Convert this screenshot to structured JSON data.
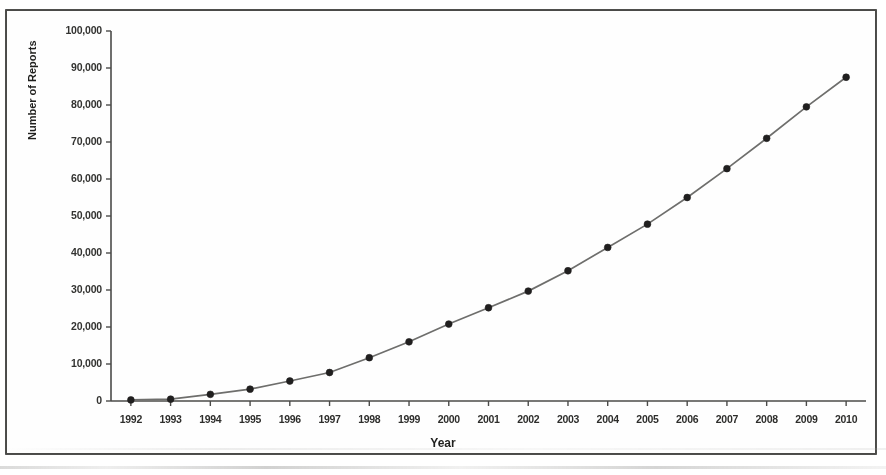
{
  "chart_data": {
    "type": "line",
    "title": "",
    "xlabel": "Year",
    "ylabel": "Number of Reports",
    "x": [
      1992,
      1993,
      1994,
      1995,
      1996,
      1997,
      1998,
      1999,
      2000,
      2001,
      2002,
      2003,
      2004,
      2005,
      2006,
      2007,
      2008,
      2009,
      2010
    ],
    "categories": [
      "1992",
      "1993",
      "1994",
      "1995",
      "1996",
      "1997",
      "1998",
      "1999",
      "2000",
      "2001",
      "2002",
      "2003",
      "2004",
      "2005",
      "2006",
      "2007",
      "2008",
      "2009",
      "2010"
    ],
    "values": [
      300,
      500,
      1800,
      3200,
      5400,
      7700,
      11700,
      16000,
      20800,
      25200,
      29700,
      35200,
      41500,
      47800,
      55000,
      62800,
      71000,
      79500,
      87500
    ],
    "ylim": [
      0,
      100000
    ],
    "xlim": [
      1992,
      2010
    ],
    "ytick_values": [
      0,
      10000,
      20000,
      30000,
      40000,
      50000,
      60000,
      70000,
      80000,
      90000,
      100000
    ],
    "ytick_labels": [
      "0",
      "10,000",
      "20,000",
      "30,000",
      "40,000",
      "50,000",
      "60,000",
      "70,000",
      "80,000",
      "90,000",
      "100,000"
    ],
    "grid": false,
    "legend": null,
    "marker": "filled-circle",
    "line_color": "#6e6e6c",
    "marker_color": "#201f1f",
    "axis_color": "#4b4b49",
    "background": "#ffffff"
  }
}
